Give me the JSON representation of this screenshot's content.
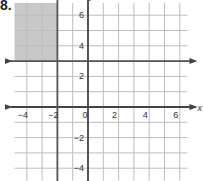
{
  "problem_number": "8.",
  "chart_data": {
    "type": "line",
    "title": "",
    "xlabel": "x",
    "ylabel": "y",
    "xlim": [
      -4.8,
      6.5
    ],
    "ylim": [
      -4.8,
      6.8
    ],
    "grid": true,
    "x_ticks": [
      "-4",
      "-2",
      "0",
      "2",
      "4",
      "6"
    ],
    "y_ticks": [
      "6",
      "4",
      "2",
      "-2",
      "-4"
    ],
    "lines": [
      {
        "name": "x = -2",
        "orientation": "vertical",
        "value": -2
      },
      {
        "name": "y = 3",
        "orientation": "horizontal",
        "value": 3
      }
    ],
    "shaded_region": {
      "description": "x < -2 and y > 3",
      "x": [
        -4.8,
        -2
      ],
      "y": [
        3,
        6.8
      ],
      "color": "#c8c8c8"
    },
    "colors": {
      "grid": "#bdbdbd",
      "axis": "#444444",
      "shade": "#c8c8c8"
    }
  }
}
